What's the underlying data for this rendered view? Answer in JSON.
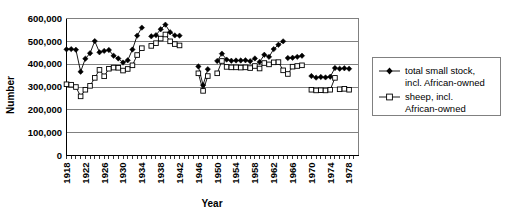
{
  "chart_data": {
    "type": "line",
    "title": "",
    "xlabel": "Year",
    "ylabel": "Number",
    "xlim": [
      1918,
      1980
    ],
    "ylim": [
      0,
      600000
    ],
    "grid": true,
    "legend_position": "right",
    "ytick_labels": [
      "600,000",
      "500,000",
      "400,000",
      "300,000",
      "200,000",
      "100,000",
      "0"
    ],
    "ytick_values": [
      600000,
      500000,
      400000,
      300000,
      200000,
      100000,
      0
    ],
    "xtick_labels": [
      "1918",
      "1922",
      "1926",
      "1930",
      "1934",
      "1938",
      "1942",
      "1946",
      "1950",
      "1954",
      "1958",
      "1962",
      "1966",
      "1970",
      "1974",
      "1978"
    ],
    "xtick_values": [
      1918,
      1922,
      1926,
      1930,
      1934,
      1938,
      1942,
      1946,
      1950,
      1954,
      1958,
      1962,
      1966,
      1970,
      1974,
      1978
    ],
    "series": [
      {
        "name": "total small stock, incl. African-owned",
        "marker": "filled-diamond",
        "color": "#000000",
        "segments": [
          {
            "x": [
              1918,
              1919,
              1920,
              1921,
              1922,
              1923,
              1924,
              1925,
              1926,
              1927,
              1928,
              1929,
              1930,
              1931,
              1932,
              1933,
              1934
            ],
            "y": [
              465000,
              466000,
              463000,
              367000,
              424000,
              448000,
              501000,
              452000,
              458000,
              462000,
              437000,
              425000,
              407000,
              417000,
              464000,
              525000,
              560000
            ]
          },
          {
            "x": [
              1936,
              1937,
              1938,
              1939,
              1940,
              1941,
              1942
            ],
            "y": [
              522000,
              527000,
              553000,
              573000,
              540000,
              526000,
              525000
            ]
          },
          {
            "x": [
              1946,
              1947,
              1948
            ],
            "y": [
              390000,
              308000,
              378000
            ]
          },
          {
            "x": [
              1950,
              1951,
              1952,
              1953,
              1954,
              1955,
              1956,
              1957,
              1958
            ],
            "y": [
              414000,
              446000,
              420000,
              415000,
              416000,
              416000,
              417000,
              413000,
              425000
            ]
          },
          {
            "x": [
              1959,
              1960,
              1961,
              1962,
              1963,
              1964
            ],
            "y": [
              410000,
              441000,
              432000,
              466000,
              485000,
              500000
            ]
          },
          {
            "x": [
              1965,
              1966,
              1967,
              1968
            ],
            "y": [
              427000,
              428000,
              432000,
              437000
            ]
          },
          {
            "x": [
              1970,
              1971,
              1972,
              1973,
              1974,
              1975
            ],
            "y": [
              348000,
              341000,
              344000,
              342000,
              345000,
              383000
            ]
          },
          {
            "x": [
              1976,
              1977,
              1978
            ],
            "y": [
              380000,
              382000,
              380000
            ]
          }
        ]
      },
      {
        "name": "sheep, incl. African-owned",
        "marker": "open-square",
        "color": "#000000",
        "segments": [
          {
            "x": [
              1918,
              1919,
              1920,
              1921,
              1922,
              1923,
              1924,
              1925,
              1926,
              1927,
              1928,
              1929,
              1930,
              1931,
              1932,
              1933,
              1934
            ],
            "y": [
              312000,
              310000,
              300000,
              259000,
              288000,
              305000,
              340000,
              375000,
              347000,
              380000,
              385000,
              384000,
              372000,
              379000,
              395000,
              440000,
              470000
            ]
          },
          {
            "x": [
              1936,
              1937,
              1938,
              1939,
              1940,
              1941,
              1942
            ],
            "y": [
              480000,
              492000,
              512000,
              530000,
              500000,
              488000,
              482000
            ]
          },
          {
            "x": [
              1946,
              1947,
              1948
            ],
            "y": [
              360000,
              283000,
              348000
            ]
          },
          {
            "x": [
              1950,
              1951,
              1952,
              1953,
              1954,
              1955,
              1956,
              1957,
              1958
            ],
            "y": [
              360000,
              414000,
              388000,
              386000,
              386000,
              385000,
              386000,
              383000,
              392000
            ]
          },
          {
            "x": [
              1959,
              1960,
              1961,
              1962,
              1963,
              1964
            ],
            "y": [
              381000,
              405000,
              399000,
              408000,
              409000,
              373000
            ]
          },
          {
            "x": [
              1965,
              1966,
              1967,
              1968
            ],
            "y": [
              357000,
              389000,
              392000,
              395000
            ]
          },
          {
            "x": [
              1970,
              1971,
              1972,
              1973,
              1974,
              1975
            ],
            "y": [
              288000,
              285000,
              286000,
              285000,
              288000,
              340000
            ]
          },
          {
            "x": [
              1976,
              1977,
              1978
            ],
            "y": [
              290000,
              292000,
              288000
            ]
          }
        ]
      }
    ],
    "legend": [
      {
        "line1": "total small stock,",
        "line2": "incl. African-owned",
        "marker": "filled-diamond"
      },
      {
        "line1": "sheep, incl.",
        "line2": "African-owned",
        "marker": "open-square"
      }
    ]
  }
}
